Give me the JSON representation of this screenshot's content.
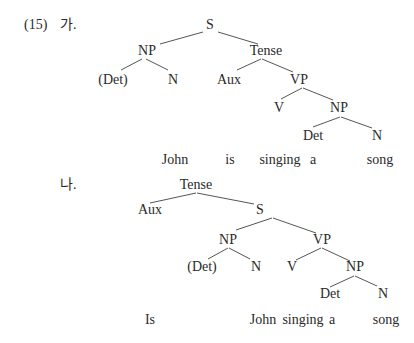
{
  "example_number": "(15)",
  "trees": [
    {
      "label": "가.",
      "nodes": {
        "S": "S",
        "NP": "NP",
        "Tense": "Tense",
        "Det_opt": "(Det)",
        "N1": "N",
        "Aux": "Aux",
        "VP": "VP",
        "V": "V",
        "NP2": "NP",
        "Det": "Det",
        "N2": "N"
      },
      "words": [
        "John",
        "is",
        "singing",
        "a",
        "song"
      ]
    },
    {
      "label": "나.",
      "nodes": {
        "Tense": "Tense",
        "Aux": "Aux",
        "S": "S",
        "NP": "NP",
        "VP": "VP",
        "Det_opt": "(Det)",
        "N1": "N",
        "V": "V",
        "NP2": "NP",
        "Det": "Det",
        "N2": "N"
      },
      "words": [
        "Is",
        "John",
        "singing",
        "a",
        "song"
      ]
    }
  ]
}
